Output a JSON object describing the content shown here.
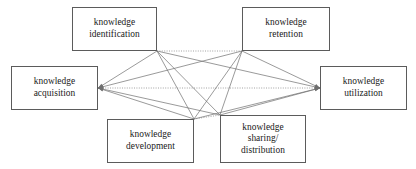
{
  "diagram": {
    "canvas": {
      "width": 416,
      "height": 169,
      "background": "#ffffff"
    },
    "style": {
      "box_border_color": "#5b5b5b",
      "solid_edge_color": "#6e6e6e",
      "dotted_edge_color": "#8a8a8a",
      "text_color": "#1a1a1a"
    },
    "nodes": [
      {
        "id": "identification",
        "label": "knowledge\nidentification",
        "x": 72,
        "y": 7,
        "w": 85,
        "h": 44,
        "hub_x": 157,
        "hub_y": 51
      },
      {
        "id": "retention",
        "label": "knowledge\nretention",
        "x": 242,
        "y": 7,
        "w": 88,
        "h": 44,
        "hub_x": 242,
        "hub_y": 51
      },
      {
        "id": "acquisition",
        "label": "knowledge\nacquisition",
        "x": 11,
        "y": 66,
        "w": 87,
        "h": 44,
        "hub_x": 98,
        "hub_y": 88
      },
      {
        "id": "utilization",
        "label": "knowledge\nutilization",
        "x": 320,
        "y": 66,
        "w": 87,
        "h": 44,
        "hub_x": 320,
        "hub_y": 88
      },
      {
        "id": "development",
        "label": "knowledge\ndevelopment",
        "x": 107,
        "y": 119,
        "w": 87,
        "h": 44,
        "hub_x": 194,
        "hub_y": 119
      },
      {
        "id": "sharing",
        "label": "knowledge\nsharing/\ndistribution",
        "x": 220,
        "y": 115,
        "w": 86,
        "h": 48,
        "hub_x": 220,
        "hub_y": 115
      }
    ],
    "edges": [
      {
        "from": "acquisition",
        "to": "identification",
        "style": "solid",
        "arrow": "both"
      },
      {
        "from": "acquisition",
        "to": "retention",
        "style": "solid",
        "arrow": "both"
      },
      {
        "from": "acquisition",
        "to": "development",
        "style": "solid",
        "arrow": "both"
      },
      {
        "from": "acquisition",
        "to": "sharing",
        "style": "solid",
        "arrow": "both"
      },
      {
        "from": "acquisition",
        "to": "utilization",
        "style": "dotted",
        "arrow": "both"
      },
      {
        "from": "identification",
        "to": "retention",
        "style": "dotted",
        "arrow": "both"
      },
      {
        "from": "identification",
        "to": "development",
        "style": "solid",
        "arrow": "both"
      },
      {
        "from": "identification",
        "to": "sharing",
        "style": "solid",
        "arrow": "both"
      },
      {
        "from": "identification",
        "to": "utilization",
        "style": "solid",
        "arrow": "both"
      },
      {
        "from": "retention",
        "to": "development",
        "style": "solid",
        "arrow": "both"
      },
      {
        "from": "retention",
        "to": "sharing",
        "style": "solid",
        "arrow": "both"
      },
      {
        "from": "retention",
        "to": "utilization",
        "style": "solid",
        "arrow": "both"
      },
      {
        "from": "development",
        "to": "sharing",
        "style": "dotted",
        "arrow": "both"
      },
      {
        "from": "development",
        "to": "utilization",
        "style": "solid",
        "arrow": "both"
      },
      {
        "from": "sharing",
        "to": "utilization",
        "style": "solid",
        "arrow": "both"
      }
    ]
  }
}
